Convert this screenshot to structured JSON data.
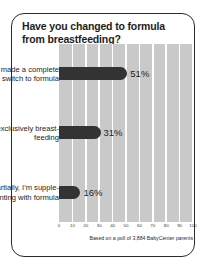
{
  "card": {
    "title": "Have you changed to formula from breastfeeding?",
    "footnote": "Based on a poll of 3,884 BabyCenter parents"
  },
  "chart_data": {
    "type": "bar",
    "orientation": "horizontal",
    "title": "Have you changed to formula from breastfeeding?",
    "xlabel": "",
    "ylabel": "",
    "xlim": [
      0,
      100
    ],
    "grid": true,
    "legend": null,
    "categories": [
      "Yes, I've made a complete switch to formula",
      "No, I'm exclusively breast-feeding",
      "Partially, I'm supple-menting with formula"
    ],
    "values": [
      51,
      31,
      16
    ],
    "value_labels": [
      "51%",
      "31%",
      "16%"
    ],
    "xticks": [
      0,
      10,
      20,
      30,
      40,
      50,
      60,
      70,
      80,
      90,
      100
    ],
    "xticklabels": [
      "0",
      "10",
      "20",
      "30",
      "40",
      "50",
      "60",
      "70",
      "80",
      "90",
      "100"
    ],
    "bar_color": "#333333",
    "plot_background": "#c9c9c9",
    "gridline_color": "#ffffff",
    "annotation": "Based on a poll of 3,884 BabyCenter parents"
  }
}
